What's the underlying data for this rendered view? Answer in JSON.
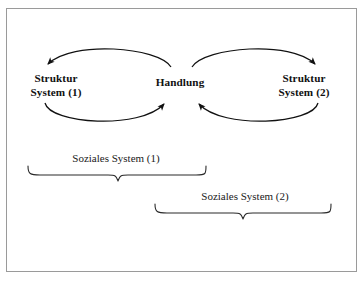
{
  "figure": {
    "background_color": "#ffffff",
    "border_color": "#9a9a9a",
    "ink_color": "#111111"
  },
  "nodes": {
    "struktur_1": {
      "line1": "Struktur",
      "line2": "System (1)"
    },
    "handlung": {
      "line1": "Handlung"
    },
    "struktur_2": {
      "line1": "Struktur",
      "line2": "System (2)"
    }
  },
  "braces": {
    "soziales_1": {
      "label": "Soziales System (1)"
    },
    "soziales_2": {
      "label": "Soziales System (2)"
    }
  },
  "arrows": [
    {
      "name": "struktur1-to-handlung",
      "from": "Struktur System (1)",
      "to": "Handlung",
      "direction": "right",
      "curve": "lower-arc"
    },
    {
      "name": "handlung-to-struktur1",
      "from": "Handlung",
      "to": "Struktur System (1)",
      "direction": "left",
      "curve": "upper-arc"
    },
    {
      "name": "handlung-to-struktur2",
      "from": "Handlung",
      "to": "Struktur System (2)",
      "direction": "right",
      "curve": "upper-arc"
    },
    {
      "name": "struktur2-to-handlung",
      "from": "Struktur System (2)",
      "to": "Handlung",
      "direction": "left",
      "curve": "lower-arc"
    }
  ]
}
